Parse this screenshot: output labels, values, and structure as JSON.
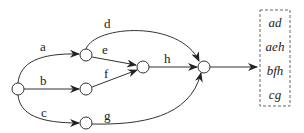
{
  "diagram": {
    "type": "path-graph",
    "nodes": [
      {
        "id": "s",
        "x": 18,
        "y": 89
      },
      {
        "id": "n1",
        "x": 86,
        "y": 55
      },
      {
        "id": "n2",
        "x": 86,
        "y": 89
      },
      {
        "id": "n3",
        "x": 86,
        "y": 123
      },
      {
        "id": "n4",
        "x": 143,
        "y": 67
      },
      {
        "id": "t",
        "x": 204,
        "y": 67
      }
    ],
    "edges": [
      {
        "label": "a",
        "from": "s",
        "to": "n1"
      },
      {
        "label": "b",
        "from": "s",
        "to": "n2"
      },
      {
        "label": "c",
        "from": "s",
        "to": "n3"
      },
      {
        "label": "d",
        "from": "n1",
        "to": "t"
      },
      {
        "label": "e",
        "from": "n1",
        "to": "n4"
      },
      {
        "label": "f",
        "from": "n2",
        "to": "n4"
      },
      {
        "label": "g",
        "from": "n3",
        "to": "t"
      },
      {
        "label": "h",
        "from": "n4",
        "to": "t"
      }
    ],
    "paths_box": {
      "paths": [
        "ad",
        "aeh",
        "bfh",
        "cg"
      ]
    }
  }
}
